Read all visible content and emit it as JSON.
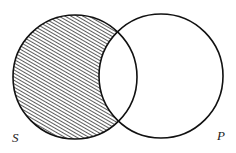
{
  "diagram": {
    "type": "venn",
    "sets": [
      {
        "id": "S",
        "label": "S",
        "cx": 75,
        "cy": 77,
        "r": 62
      },
      {
        "id": "P",
        "label": "P",
        "cx": 161,
        "cy": 76,
        "r": 62
      }
    ],
    "shaded_region": "S minus P",
    "colors": {
      "stroke": "#111111",
      "hatch": "#333333",
      "background": "#ffffff"
    }
  }
}
